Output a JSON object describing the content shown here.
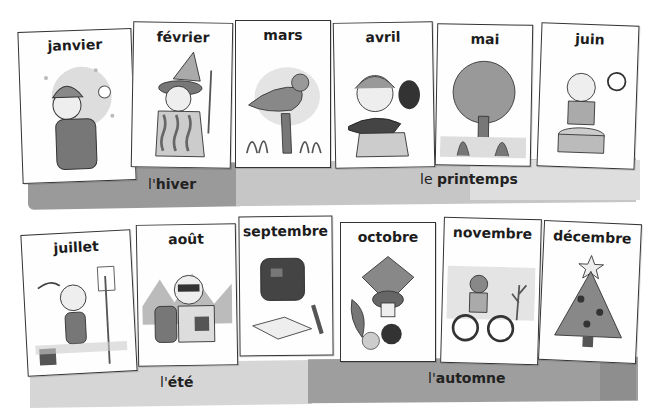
{
  "seasons": {
    "winter": {
      "article": "l'",
      "word": "hiver",
      "color": "#9a9a9a"
    },
    "spring": {
      "article": "le ",
      "word": "printemps",
      "color": "#c4c4c4"
    },
    "summer": {
      "article": "l'",
      "word": "été",
      "color": "#d6d6d6"
    },
    "autumn": {
      "article": "l'",
      "word": "automne",
      "color": "#9e9e9e"
    }
  },
  "months": [
    {
      "name": "janvier",
      "illustration": "child-snowball-icon"
    },
    {
      "name": "février",
      "illustration": "clown-carnival-icon"
    },
    {
      "name": "mars",
      "illustration": "singing-bird-icon"
    },
    {
      "name": "avril",
      "illustration": "girl-fish-egg-icon"
    },
    {
      "name": "mai",
      "illustration": "tree-lily-icon"
    },
    {
      "name": "juin",
      "illustration": "boy-drum-icon"
    },
    {
      "name": "juillet",
      "illustration": "girl-beach-net-icon"
    },
    {
      "name": "août",
      "illustration": "hiker-binoculars-icon"
    },
    {
      "name": "septembre",
      "illustration": "schoolbag-book-icon"
    },
    {
      "name": "octobre",
      "illustration": "leaves-mushroom-chestnut-icon"
    },
    {
      "name": "novembre",
      "illustration": "child-bicycle-icon"
    },
    {
      "name": "décembre",
      "illustration": "christmas-tree-icon"
    }
  ]
}
